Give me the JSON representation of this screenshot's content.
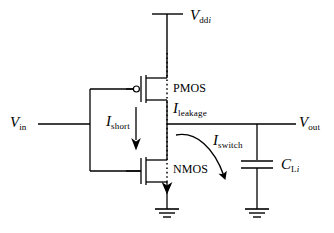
{
  "figure": {
    "type": "circuit-schematic",
    "background_color": "#ffffff",
    "line_color": "#000000"
  },
  "labels": {
    "vdd": {
      "symbol": "V",
      "subscript": "dd",
      "subscript_italic": "i"
    },
    "vin": {
      "symbol": "V",
      "subscript": "in"
    },
    "vout": {
      "symbol": "V",
      "subscript": "out"
    },
    "pmos": "PMOS",
    "nmos": "NMOS",
    "i_short": {
      "symbol": "I",
      "subscript": "short"
    },
    "i_leakage": {
      "symbol": "I",
      "subscript": "leakage"
    },
    "i_switch": {
      "symbol": "I",
      "subscript": "switch"
    },
    "c_load": {
      "symbol": "C",
      "subscript": "L",
      "subscript_italic": "i"
    }
  },
  "components": [
    {
      "name": "pmos-transistor",
      "type": "mosfet",
      "polarity": "p-channel",
      "bubble": true
    },
    {
      "name": "nmos-transistor",
      "type": "mosfet",
      "polarity": "n-channel",
      "bubble": false
    },
    {
      "name": "load-capacitor",
      "type": "capacitor"
    },
    {
      "name": "ground-nmos-source",
      "type": "ground"
    },
    {
      "name": "ground-capacitor",
      "type": "ground"
    },
    {
      "name": "supply-terminal",
      "type": "terminal"
    }
  ],
  "currents": [
    {
      "name": "short-circuit-current",
      "style": "solid-arrow",
      "direction": "down"
    },
    {
      "name": "leakage-current",
      "style": "dotted-arrow",
      "direction": "down"
    },
    {
      "name": "switching-current",
      "style": "curved-arrow",
      "direction": "down-right"
    }
  ]
}
